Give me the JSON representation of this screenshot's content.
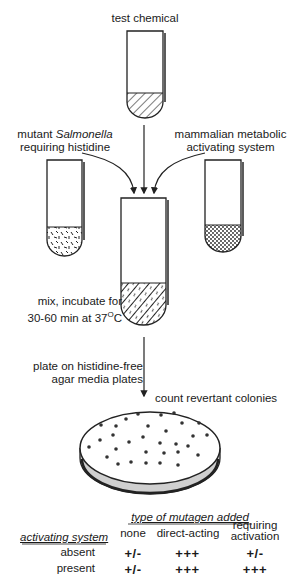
{
  "labels": {
    "test_chemical": "test chemical",
    "salmonella_prefix": "mutant ",
    "salmonella_italic": "Salmonella",
    "salmonella_line2": "requiring histidine",
    "mammalian_line1": "mammalian metabolic",
    "mammalian_line2": "activating system",
    "mix_line1": "mix, incubate for",
    "mix_line2_prefix": "30-60 min at 37",
    "mix_degree": "O",
    "mix_unit": "C",
    "plate_line1": "plate on histidine-free",
    "plate_line2": "agar media plates",
    "count": "count revertant colonies"
  },
  "table": {
    "header_title": "type of mutagen added",
    "row_header": "activating system",
    "columns": [
      "none",
      "direct-acting",
      "requiring",
      "activation"
    ],
    "rows": [
      {
        "label": "absent",
        "values": [
          "+/-",
          "+++",
          "+/-"
        ]
      },
      {
        "label": "present",
        "values": [
          "+/-",
          "+++",
          "+++"
        ]
      }
    ]
  }
}
